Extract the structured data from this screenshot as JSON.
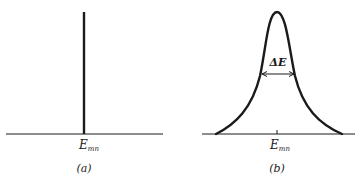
{
  "figure": {
    "panel_a": {
      "energy_label_main": "E",
      "energy_label_sub": "mn",
      "caption": "(a)",
      "description": "sharp line spectrum"
    },
    "panel_b": {
      "width_label": "ΔE",
      "energy_label_main": "E",
      "energy_label_sub": "mn",
      "caption": "(b)",
      "description": "broadened line shape"
    }
  },
  "colors": {
    "ink": "#1a1a1a",
    "background": "#ffffff"
  }
}
